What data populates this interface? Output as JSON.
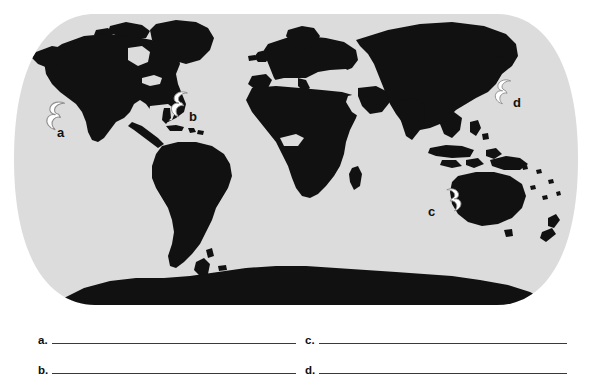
{
  "page": {
    "background_color": "#ffffff"
  },
  "map": {
    "name": "world-map",
    "projection": "Robinson-like oval world projection",
    "ocean_color": "#dcdcdc",
    "land_color": "#111111",
    "edge_shape": "rounded-rectangle oval with flat top and bottom"
  },
  "markers": [
    {
      "id": "a",
      "label": "a",
      "icon": "hurricane-icon",
      "hemisphere": "northern",
      "spin": "counterclockwise",
      "mirrored": false,
      "region": "Eastern North Pacific Ocean",
      "x": 43,
      "y": 99,
      "label_x": 57,
      "label_y": 133
    },
    {
      "id": "b",
      "label": "b",
      "icon": "hurricane-icon",
      "hemisphere": "northern",
      "spin": "counterclockwise",
      "mirrored": false,
      "region": "North Atlantic Ocean / Caribbean",
      "x": 168,
      "y": 93,
      "label_x": 188,
      "label_y": 118
    },
    {
      "id": "c",
      "label": "c",
      "icon": "hurricane-icon",
      "hemisphere": "southern",
      "spin": "clockwise",
      "mirrored": true,
      "region": "Indian Ocean off northwestern Australia",
      "x": 440,
      "y": 188,
      "label_x": 430,
      "label_y": 214
    },
    {
      "id": "d",
      "label": "d",
      "icon": "hurricane-icon",
      "hemisphere": "northern",
      "spin": "counterclockwise",
      "mirrored": false,
      "region": "Northwest Pacific Ocean near Japan",
      "x": 492,
      "y": 78,
      "label_x": 512,
      "label_y": 103
    }
  ],
  "answers": {
    "rows": [
      {
        "id": "a",
        "tag": "a.",
        "value": ""
      },
      {
        "id": "b",
        "tag": "b.",
        "value": ""
      },
      {
        "id": "c",
        "tag": "c.",
        "value": ""
      },
      {
        "id": "d",
        "tag": "d.",
        "value": ""
      }
    ],
    "rule_color": "#3a3a3a"
  }
}
